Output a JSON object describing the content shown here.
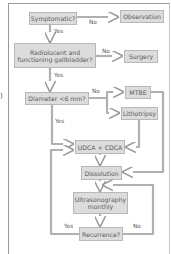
{
  "diagram": {
    "nodes": {
      "symptomatic": "Symptomatic?",
      "observation": "Observation",
      "radiolucent_line1": "Radiolucent and",
      "radiolucent_line2": "functioning gallbladder?",
      "surgery": "Surgery",
      "diameter": "Diameter <6 mm?",
      "mtbe": "MTBE",
      "lithotripsy": "Lithotripsy",
      "udca_cdca": "UDCA + CDCA",
      "dissolution": "Dissolution",
      "ultrasonography_line1": "Ultrasonography",
      "ultrasonography_line2": "monthly",
      "recurrence": "Recurrence?"
    },
    "edge_labels": {
      "symptomatic_no": "No",
      "symptomatic_yes": "Yes",
      "radiolucent_no": "No",
      "radiolucent_yes": "Yes",
      "diameter_no": "No",
      "diameter_yes": "Yes",
      "recurrence_yes": "Yes",
      "recurrence_no": "No"
    },
    "cut_off_left_text": ")",
    "colors": {
      "box_fill": "#dcdcdc",
      "box_border": "#b8b8b8",
      "wire": "#a8a8a8",
      "text": "#5a5a5a"
    }
  }
}
